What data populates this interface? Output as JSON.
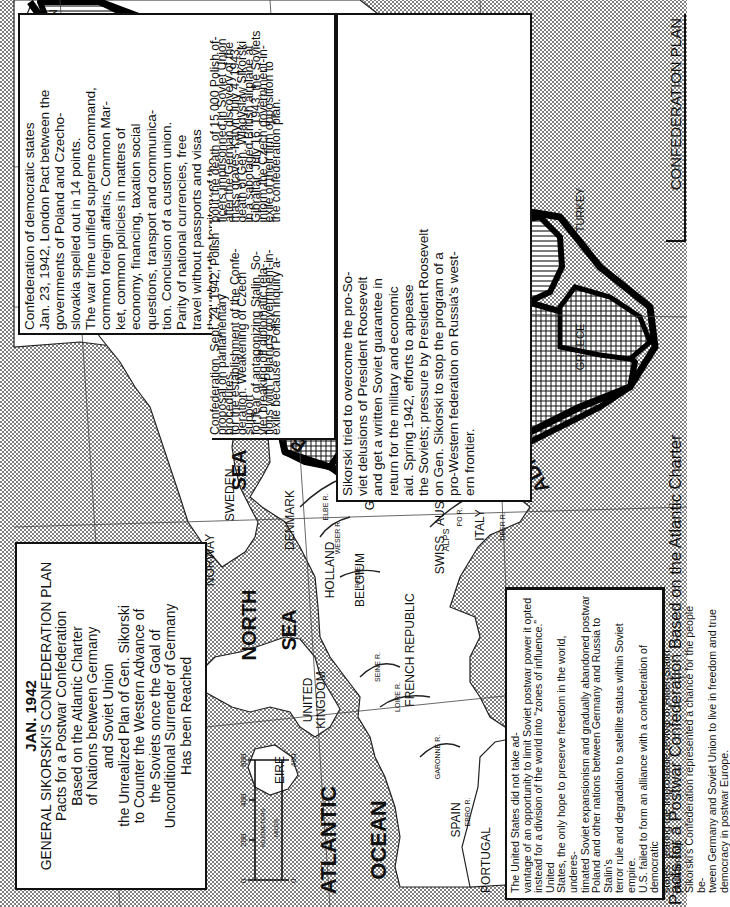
{
  "title_box": {
    "date": "JAN. 1942",
    "lines": [
      "GENERAL SIKORSKI'S CONFEDERATION PLAN",
      "Pacts for a Postwar Confederation",
      "Based on the Atlantic Charter",
      "of Nations between Germany",
      "and Soviet Union",
      "the Unrealized Plan of Gen. Sikorski",
      "to Counter the Western Advance of",
      "the Soviets once the Goal of",
      "Unconditional Surrender of Germany",
      "Has been Reached"
    ]
  },
  "main_text": {
    "lines": [
      "Confederation of democratic states",
      "Jan. 23, 1942, London Pact between the",
      "governments of Poland and Czecho-",
      "slovakia spelled out in 14 points.",
      "The war time unified supreme command,",
      "common foreign affairs, Common Mar-",
      "ket, common policies in matters of",
      "economy, financing, taxation social",
      "questions, transport and communica-",
      "tion. Conclusion of a custom union.",
      "Parity of national currencies, free",
      "travel without passports and visas",
      "throughout the territory of the"
    ],
    "lines_continued": [
      "Confederation. Sept. 24, 1942, Polish",
      "proposal on parliamentary procedures",
      "for the establishment of the Confe-",
      "deration. Weakening of Czech support",
      "for fear of antagonizing Stalin. So-",
      "viet breaking off diplomatic rela-",
      "tions with Poland's government-in-",
      "exile because of Polish inquiry a-",
      "bout the death of 15,000 Polish of-",
      "ficers imprisonned in Soviet Union",
      "after the German discovery of the",
      "mass graves-Katyn.July 4, 1943,",
      "death of Gen. Wladyslaw Sikorski",
      "in a sabotaged British airplane at",
      "Gibraltar. July 16, 1943, the Soviets",
      "inform the Czech government-in-",
      "exile of their firm opposition to",
      "the confederation plan."
    ]
  },
  "sikorski_text": {
    "lines": [
      "Sikorski tried to overcome the pro-So-",
      "viet delusions of President Roosevelt",
      "and get a written Soviet guarantee in",
      "return for the military and economic",
      "aid. Spring 1942, efforts to appease",
      "the Soviets; pressure by President Roosevelt",
      "on Gen. Sikorski to stop the program of a",
      "pro-Western federation on Russia's west-",
      "ern frontier."
    ]
  },
  "us_text": {
    "lines": [
      "The United States did not take ad-",
      "vantage of an opportunity to limit Soviet postwar power it opted",
      "instead for a division of the world into \"zones of influence.\" United",
      "States, the only hope to preserve freedom in the world, underes-",
      "timated Soviet expansionism and gradually abandoned postwar",
      "Poland and other nations between Germany and Russia to Stalin's",
      "terror rule and degradation to satellite status within Soviet empire.",
      "U.S. failed to form an alliance with a confederation of democratic",
      "states, fearing the improbable revival of Hitler-Stalin partnership.",
      "Sikorski's Confederation represented a chance for the people be-",
      "tween Germany and Soviet Union to live in freedom and true",
      "democracy in postwar Europe."
    ]
  },
  "captions": {
    "bottom_left": "Pacts for a Postwar Confederation Based on the Atlantic Charter",
    "bottom_right": "CONFEDERATION PLAN"
  },
  "map": {
    "labels": {
      "soviet_union_ne": [
        "SOVIET",
        "UNION"
      ],
      "soviet_union_mid": [
        "SOVIET",
        "UNION"
      ],
      "meridian": "EUROPE CENTRAL MERIDIAN",
      "finland": "FINLAND",
      "estonia": "ESTONIA",
      "latvia": "LATVIA",
      "lithuania": "LITHUANIA",
      "poland": "POLAND",
      "pact_date_1": "Jan. 23, 1942",
      "czechoslovakia": "CZECHOSLOVAKIA",
      "hungary": "HUNGARY",
      "romania": "ROMANIA",
      "bulgaria": "BULGARIA",
      "yugoslavia": "YUGOSLAVIA",
      "pact_date_2": "JAN. 15, 1942",
      "greece": "GREECE",
      "turkey": "TURKEY",
      "black_sea": "BLA",
      "adriatic": "ADRIATIC",
      "baltic": "BALTIC",
      "baltic_sea": "SEA",
      "sweden": "SWEDEN",
      "norway": "NORWAY",
      "denmark": "DENMARK",
      "north_sea_1": "NORTH",
      "north_sea_2": "SEA",
      "germany": "GERMANY",
      "holland": "HOLLAND",
      "belgium": "BELGIUM",
      "swiss": "SWISS",
      "austria": "AUSTRIA",
      "alps": "ALPS",
      "italy": "ITALY",
      "french_republic": "FRENCH REPUBLIC",
      "united_kingdom": [
        "UNITED",
        "KINGDOM"
      ],
      "eire": "EIRE",
      "atlantic": "ATLANTIC",
      "ocean": "OCEAN",
      "spain": "SPAIN",
      "portugal": "PORTUGAL",
      "med_sea": "SEA",
      "rivers": [
        "ELBE R.",
        "WESER R.",
        "RHINE",
        "SEINE R.",
        "LOIRE R.",
        "GARONNE R.",
        "EBRO R.",
        "TIBER R.",
        "PO R.",
        "DNIEPR R.",
        "DANUBE R.",
        "DVINA R.",
        "VORMA R.",
        "PSKOV L."
      ]
    },
    "scale": {
      "km_ticks": [
        "0",
        "200",
        "400",
        "600"
      ],
      "mi_ticks": [
        "0",
        "400"
      ],
      "km_label": "KILOMETERS",
      "mi_label": "MILES"
    }
  }
}
